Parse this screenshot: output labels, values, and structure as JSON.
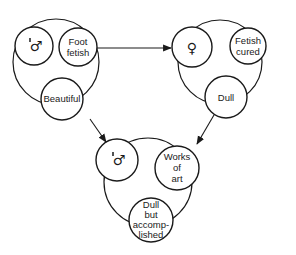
{
  "diagram": {
    "title": "",
    "colors": {
      "stroke": "#1a1a1a",
      "background": "#ffffff"
    },
    "groups": [
      {
        "id": "group-1",
        "nodes": [
          {
            "id": "g1-male",
            "symbol": "male-with-mark-icon",
            "text": "♂",
            "lines": [
              "♂"
            ]
          },
          {
            "id": "g1-foot-fetish",
            "lines": [
              "Foot",
              "fetish"
            ]
          },
          {
            "id": "g1-beautiful",
            "lines": [
              "Beautiful"
            ]
          }
        ]
      },
      {
        "id": "group-2",
        "nodes": [
          {
            "id": "g2-female",
            "symbol": "female-icon",
            "text": "♀",
            "lines": [
              "♀"
            ]
          },
          {
            "id": "g2-fetish-cured",
            "lines": [
              "Fetish",
              "cured"
            ]
          },
          {
            "id": "g2-dull",
            "lines": [
              "Dull"
            ]
          }
        ]
      },
      {
        "id": "group-3",
        "nodes": [
          {
            "id": "g3-male",
            "symbol": "male-with-mark-icon",
            "text": "♂",
            "lines": [
              "♂"
            ]
          },
          {
            "id": "g3-works-of-art",
            "lines": [
              "Works",
              "of",
              "art"
            ]
          },
          {
            "id": "g3-dull-but-accomplished",
            "lines": [
              "Dull",
              "but",
              "accomp-",
              "lished"
            ]
          }
        ]
      }
    ],
    "edges": [
      {
        "from": "g1-foot-fetish",
        "to": "g2-female"
      },
      {
        "from": "g1-beautiful",
        "to": "g3-male"
      },
      {
        "from": "g2-dull",
        "to": "g3-works-of-art"
      }
    ]
  }
}
